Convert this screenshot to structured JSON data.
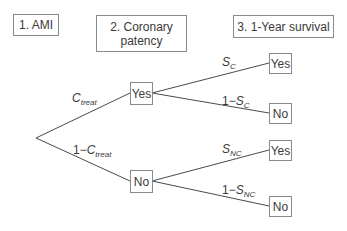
{
  "headers": {
    "stage1": "1. AMI",
    "stage2_line1": "2. Coronary",
    "stage2_line2": "patency",
    "stage3": "3. 1-Year survival"
  },
  "nodes": {
    "patency_yes": "Yes",
    "patency_no": "No",
    "survival_c_yes": "Yes",
    "survival_c_no": "No",
    "survival_nc_yes": "Yes",
    "survival_nc_no": "No"
  },
  "edges": {
    "c_treat": {
      "prefix": "",
      "symbol": "C",
      "sub": "treat"
    },
    "one_minus_c_treat": {
      "prefix": "1−",
      "symbol": "C",
      "sub": "treat"
    },
    "s_c": {
      "prefix": "",
      "symbol": "S",
      "sub": "C"
    },
    "one_minus_s_c": {
      "prefix": "1−",
      "symbol": "S",
      "sub": "C"
    },
    "s_nc": {
      "prefix": "",
      "symbol": "S",
      "sub": "NC"
    },
    "one_minus_s_nc": {
      "prefix": "1−",
      "symbol": "S",
      "sub": "NC"
    }
  },
  "colors": {
    "line": "#4a4a4a",
    "box_border": "#8a8a8a",
    "text": "#3a3a3a"
  }
}
